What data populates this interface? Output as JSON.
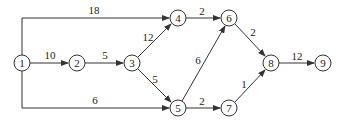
{
  "diagram": {
    "type": "network-graph",
    "nodes": [
      {
        "id": "1",
        "label": "1",
        "x": 22,
        "y": 63
      },
      {
        "id": "2",
        "label": "2",
        "x": 77,
        "y": 63
      },
      {
        "id": "3",
        "label": "3",
        "x": 132,
        "y": 63
      },
      {
        "id": "4",
        "label": "4",
        "x": 178,
        "y": 18
      },
      {
        "id": "5",
        "label": "5",
        "x": 178,
        "y": 108
      },
      {
        "id": "6",
        "label": "6",
        "x": 229,
        "y": 18
      },
      {
        "id": "7",
        "label": "7",
        "x": 229,
        "y": 108
      },
      {
        "id": "8",
        "label": "8",
        "x": 271,
        "y": 63
      },
      {
        "id": "9",
        "label": "9",
        "x": 323,
        "y": 63
      }
    ],
    "edges": [
      {
        "from": "1",
        "to": "4",
        "weight": "18"
      },
      {
        "from": "1",
        "to": "2",
        "weight": "10"
      },
      {
        "from": "1",
        "to": "5",
        "weight": "6"
      },
      {
        "from": "2",
        "to": "3",
        "weight": "5"
      },
      {
        "from": "3",
        "to": "4",
        "weight": "12"
      },
      {
        "from": "3",
        "to": "5",
        "weight": "5"
      },
      {
        "from": "4",
        "to": "6",
        "weight": "2"
      },
      {
        "from": "5",
        "to": "6",
        "weight": "6"
      },
      {
        "from": "5",
        "to": "7",
        "weight": "2"
      },
      {
        "from": "6",
        "to": "8",
        "weight": "2"
      },
      {
        "from": "7",
        "to": "8",
        "weight": "1"
      },
      {
        "from": "8",
        "to": "9",
        "weight": "12"
      }
    ]
  }
}
